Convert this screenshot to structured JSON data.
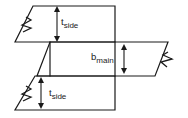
{
  "diagram": {
    "stroke_color": "#1a1a1a",
    "background_color": "#ffffff",
    "labels": {
      "t_side_top": {
        "base": "t",
        "sub": "side"
      },
      "b_main": {
        "base": "b",
        "sub": "main"
      },
      "t_side_bottom": {
        "base": "t",
        "sub": "side"
      }
    },
    "shapes": {
      "top_side_plate": {
        "name": "top-side-plate",
        "points": "33,6 115,6 115,42 15,42"
      },
      "main_plate": {
        "name": "main-plate",
        "points": "50,42 168,42 155,76 37,76"
      },
      "bottom_side_plate": {
        "name": "bottom-side-plate",
        "points": "35,76 115,76 115,110 15,110"
      }
    },
    "break_marks": {
      "top_left": "26,17 31,20 22,25 31,28 23,32",
      "middle_right": "168,52 163,55 172,59 161,62 167,67",
      "bottom_left": "26,86 31,89 22,94 31,97 23,101"
    },
    "dimensions": {
      "t_side_top": {
        "x": 57,
        "y_top": 8,
        "y_bottom": 40
      },
      "b_main": {
        "x": 124,
        "y_top": 44,
        "y_bottom": 74
      },
      "t_side_bottom": {
        "x": 41,
        "y_top": 78,
        "y_bottom": 108
      }
    }
  }
}
